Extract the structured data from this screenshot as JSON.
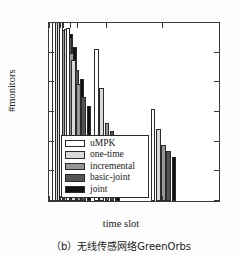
{
  "chart_data": {
    "type": "bar",
    "title": "",
    "xlabel": "time slot",
    "ylabel": "#monitors",
    "categories": [
      "1.5",
      "2",
      "3",
      "4",
      "8",
      "16"
    ],
    "legend_position": "center-left",
    "grid": false,
    "xlim": [
      0,
      24
    ],
    "ylim": [
      0,
      300
    ],
    "yticks": [
      0,
      50,
      100,
      150,
      200,
      250,
      300
    ],
    "xticks": [
      0,
      1.5,
      2,
      3,
      4,
      8,
      16,
      24
    ],
    "series": [
      {
        "name": "uMPK",
        "color": "#ffffff",
        "values": [
          307,
          306,
          304,
          291,
          257,
          155
        ]
      },
      {
        "name": "one-time",
        "color": "#d9d9d9",
        "values": [
          305,
          304,
          290,
          238,
          191,
          121
        ]
      },
      {
        "name": "incremental",
        "color": "#969696",
        "values": [
          299,
          288,
          250,
          198,
          132,
          94
        ]
      },
      {
        "name": "basic-joint",
        "color": "#545454",
        "values": [
          288,
          275,
          220,
          176,
          118,
          84
        ]
      },
      {
        "name": "joint",
        "color": "#111111",
        "values": [
          282,
          259,
          205,
          160,
          97,
          74
        ]
      }
    ]
  },
  "axis": {
    "y_tick_labels": [
      "0",
      "50",
      "100",
      "150",
      "200",
      "250",
      "300"
    ],
    "x_tick_labels": [
      "0",
      "1.5",
      "2",
      "3",
      "4",
      "8",
      "16",
      "24"
    ],
    "y_title": "#monitors",
    "x_title": "time slot"
  },
  "legend": {
    "items": [
      {
        "label": "uMPK"
      },
      {
        "label": "one-time"
      },
      {
        "label": "incremental"
      },
      {
        "label": "basic-joint"
      },
      {
        "label": "joint"
      }
    ]
  },
  "caption": {
    "text": "（b）无线传感网络GreenOrbs"
  }
}
